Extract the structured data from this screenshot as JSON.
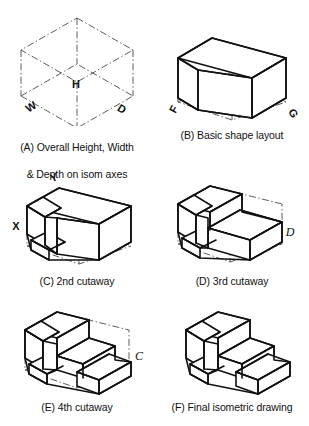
{
  "figure": {
    "panel_count": 6,
    "line_colors": {
      "visible_edge": "#111111",
      "construction_line": "#4a4a4a",
      "background": "#ffffff"
    }
  },
  "panels": [
    {
      "id": "A",
      "caption": "(A) Overall Height, Width\n& Depth on isom axes",
      "caption_line_1": "(A) Overall Height, Width",
      "caption_line_2": "& Depth on isom axes",
      "description": "Isometric construction box drawn with centre lines",
      "labels": [
        {
          "name": "height",
          "text": "H"
        },
        {
          "name": "width",
          "text": "W"
        },
        {
          "name": "depth",
          "text": "D"
        }
      ]
    },
    {
      "id": "B",
      "caption": "(B) Basic shape layout",
      "description": "L-shaped basic block cut from the construction box",
      "labels": [
        {
          "name": "corner-f",
          "text": "F"
        },
        {
          "name": "corner-g",
          "text": "G"
        }
      ]
    },
    {
      "id": "C",
      "caption": "(C) 2nd cutaway",
      "description": "Second cutaway creating a low step at the left",
      "labels": [
        {
          "name": "point-y",
          "text": "Y"
        },
        {
          "name": "point-x",
          "text": "X"
        }
      ]
    },
    {
      "id": "D",
      "caption": "(D) 3rd cutaway",
      "description": "Third cutaway removing the right hand upper block",
      "labels": [
        {
          "name": "point-d",
          "text": "D"
        }
      ]
    },
    {
      "id": "E",
      "caption": "(E) 4th cutaway",
      "description": "Fourth cutaway forming the staircase profile",
      "labels": [
        {
          "name": "point-c",
          "text": "C"
        }
      ]
    },
    {
      "id": "F",
      "caption": "(F) Final isometric drawing",
      "description": "Finished isometric solid with construction lines removed",
      "labels": []
    }
  ]
}
